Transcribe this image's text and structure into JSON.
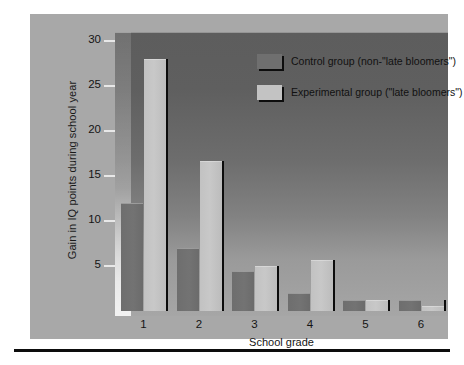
{
  "chart_data": {
    "type": "bar",
    "title": "",
    "xlabel": "School grade",
    "ylabel": "Gain in IQ points during school year",
    "categories": [
      "1",
      "2",
      "3",
      "4",
      "5",
      "6"
    ],
    "ylim": [
      0,
      31
    ],
    "yticks": [
      5,
      10,
      15,
      20,
      25,
      30
    ],
    "ytick_labels": [
      "5",
      "10",
      "15",
      "20",
      "25",
      "30"
    ],
    "grid": false,
    "legend_position": "inside top-center",
    "series": [
      {
        "name": "Control group (non-\"late bloomers\")",
        "color": "#6f6f6f",
        "values": [
          12,
          7,
          4.5,
          2,
          1.2,
          1.2
        ]
      },
      {
        "name": "Experimental group (\"late bloomers\")",
        "color": "#c3c3c3",
        "values": [
          28,
          16.7,
          5,
          5.7,
          1.2,
          0.6
        ]
      }
    ]
  },
  "legend": {
    "items": [
      {
        "label": "Control group (non-\"late bloomers\")",
        "swatch": "control"
      },
      {
        "label": "Experimental group (\"late bloomers\")",
        "swatch": "experimental"
      }
    ]
  },
  "colors": {
    "page_background": "#ffffff",
    "board_background": "#a8a8a8",
    "panel_dark": "#5d5d5d",
    "panel_light": "#a6a6a6",
    "control_bar": "#6f6f6f",
    "experimental_bar": "#c3c3c3",
    "divider": "#0c0c0c",
    "rule": "#0d0d0d",
    "text": "#141414"
  }
}
